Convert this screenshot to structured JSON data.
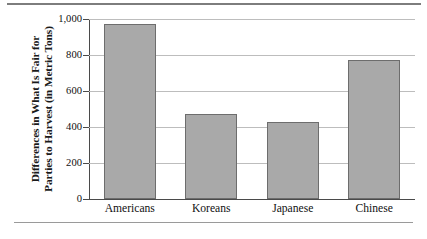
{
  "chart_data": {
    "type": "bar",
    "title": "",
    "subtitle": "",
    "xlabel": "",
    "ylabel": "Differences in What Is Fair for Parties to Harvest (in Metric Tons)",
    "ylabel_lines": [
      "Differences in What Is Fair for",
      "Parties to Harvest (in Metric Tons)"
    ],
    "categories": [
      "Americans",
      "Koreans",
      "Japanese",
      "Chinese"
    ],
    "values": [
      970,
      475,
      430,
      770
    ],
    "ylim": [
      0,
      1000
    ],
    "ytick_values": [
      0,
      200,
      400,
      600,
      800,
      1000
    ],
    "ytick_labels": [
      "0",
      "200",
      "400",
      "600",
      "800",
      "1,000"
    ],
    "grid": true,
    "legend": false,
    "legend_position": "none",
    "bar_color": "#a9a9a9",
    "bar_edge_color": "#6d6d6d",
    "gridline_color": "#bdbdbd",
    "axis_color": "#4a4a4a"
  }
}
